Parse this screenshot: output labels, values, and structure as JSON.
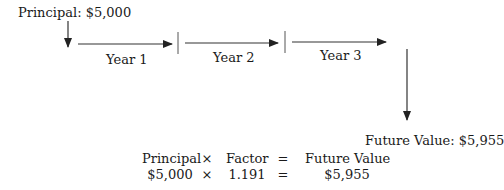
{
  "diagram": {
    "principal_label": "Principal: $5,000",
    "years": [
      {
        "label": "Year 1"
      },
      {
        "label": "Year 2"
      },
      {
        "label": "Year 3"
      }
    ],
    "future_value_label": "Future Value: $5,955",
    "equation": {
      "header": {
        "principal": "Principal",
        "times": "×",
        "factor": "Factor",
        "equals": "=",
        "future_value": "Future Value"
      },
      "values": {
        "principal": "$5,000",
        "times": "×",
        "factor": "1.191",
        "equals": "=",
        "future_value": "$5,955"
      }
    },
    "colors": {
      "line": "#333333",
      "text": "#1a1a1a",
      "background": "#ffffff"
    }
  }
}
